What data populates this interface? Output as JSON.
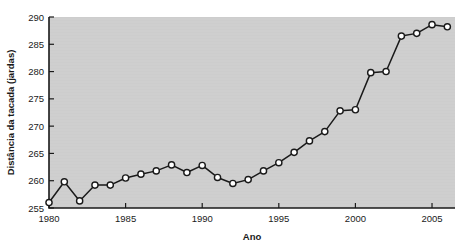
{
  "chart_data": {
    "type": "line",
    "title": "",
    "xlabel": "Ano",
    "ylabel": "Distância da tacada (jardas)",
    "xlim": [
      1980,
      2006.5
    ],
    "ylim": [
      255,
      290
    ],
    "xticks": [
      1980,
      1985,
      1990,
      1995,
      2000,
      2005
    ],
    "xticklabels": [
      "1980",
      "1985",
      "1990",
      "1995",
      "2000",
      "2005"
    ],
    "yticks": [
      255,
      260,
      265,
      270,
      275,
      280,
      285,
      290
    ],
    "yticklabels": [
      "255",
      "260",
      "265",
      "270",
      "275",
      "280",
      "285",
      "290"
    ],
    "grid": false,
    "legend": false,
    "marker": "circle-open",
    "x": [
      1980,
      1981,
      1982,
      1983,
      1984,
      1985,
      1986,
      1987,
      1988,
      1989,
      1990,
      1991,
      1992,
      1993,
      1994,
      1995,
      1996,
      1997,
      1998,
      1999,
      2000,
      2001,
      2002,
      2003,
      2004,
      2005,
      2006
    ],
    "values": [
      256.0,
      259.8,
      256.3,
      259.2,
      259.2,
      260.5,
      261.2,
      261.8,
      262.9,
      261.5,
      262.8,
      260.6,
      259.5,
      260.2,
      261.8,
      263.3,
      265.2,
      267.3,
      269.0,
      272.8,
      273.0,
      279.8,
      280.0,
      286.5,
      287.0,
      288.6,
      288.2
    ],
    "series": [
      {
        "name": "Distância da tacada",
        "values": [
          256.0,
          259.8,
          256.3,
          259.2,
          259.2,
          260.5,
          261.2,
          261.8,
          262.9,
          261.5,
          262.8,
          260.6,
          259.5,
          260.2,
          261.8,
          263.3,
          265.2,
          267.3,
          269.0,
          272.8,
          273.0,
          279.8,
          280.0,
          286.5,
          287.0,
          288.6,
          288.2
        ]
      }
    ],
    "colors": {
      "line": "#1a1a1a",
      "marker_fill": "#ffffff",
      "marker_stroke": "#1a1a1a",
      "plot_background": "#cdcdcd",
      "figure_background": "#ffffff",
      "text": "#1a1a1a"
    }
  }
}
